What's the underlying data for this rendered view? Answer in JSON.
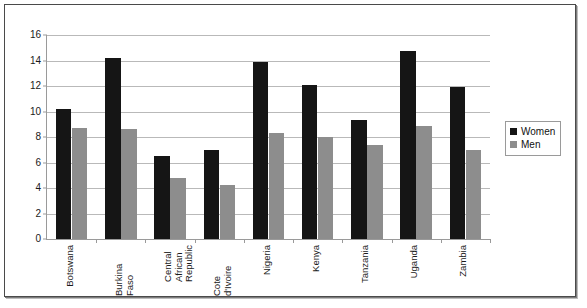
{
  "chart_data": {
    "type": "bar",
    "title": "",
    "xlabel": "",
    "ylabel": "",
    "ylim": [
      0,
      16
    ],
    "ytick_step": 2,
    "yticks": [
      "0",
      "2",
      "4",
      "6",
      "8",
      "10",
      "12",
      "14",
      "16"
    ],
    "grid": true,
    "legend_position": "right",
    "categories": [
      "Botswana",
      "Burkina Faso",
      "Central\nAfrican\nRepublic",
      "Cote d'Ivoire",
      "Nigeria",
      "Kenya",
      "Tanzania",
      "Uganda",
      "Zambia"
    ],
    "series": [
      {
        "name": "Women",
        "color": "#151515",
        "values": [
          10.2,
          14.2,
          6.5,
          7.0,
          13.85,
          12.1,
          9.3,
          14.75,
          11.95
        ]
      },
      {
        "name": "Men",
        "color": "#8d8d8d",
        "values": [
          8.7,
          8.65,
          4.8,
          4.2,
          8.35,
          8.0,
          7.4,
          8.85,
          7.0
        ]
      }
    ]
  },
  "legend": {
    "items": [
      {
        "label": "Women",
        "swatch": "women"
      },
      {
        "label": "Men",
        "swatch": "men"
      }
    ]
  }
}
